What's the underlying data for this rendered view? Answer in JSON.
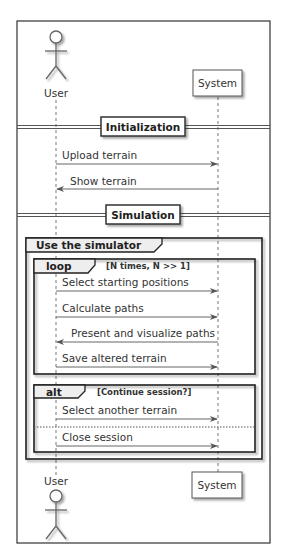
{
  "diagram": {
    "type": "sequence",
    "participants": [
      {
        "id": "user",
        "label": "User",
        "kind": "actor"
      },
      {
        "id": "system",
        "label": "System",
        "kind": "participant"
      }
    ],
    "dividers": [
      {
        "label": "Initialization"
      },
      {
        "label": "Simulation"
      }
    ],
    "messages": [
      {
        "from": "user",
        "to": "system",
        "label": "Upload terrain"
      },
      {
        "from": "system",
        "to": "user",
        "label": "Show terrain"
      },
      {
        "from": "user",
        "to": "system",
        "label": "Select starting positions"
      },
      {
        "from": "user",
        "to": "system",
        "label": "Calculate paths"
      },
      {
        "from": "system",
        "to": "user",
        "label": "Present and visualize paths"
      },
      {
        "from": "user",
        "to": "system",
        "label": "Save altered terrain"
      },
      {
        "from": "user",
        "to": "system",
        "label": "Select another terrain"
      },
      {
        "from": "user",
        "to": "system",
        "label": "Close session"
      }
    ],
    "groups": [
      {
        "kind": "group",
        "label": "Use the simulator",
        "guard": ""
      },
      {
        "kind": "loop",
        "label": "loop",
        "guard": "[N times, N >> 1]"
      },
      {
        "kind": "alt",
        "label": "alt",
        "guard": "[Continue session?]"
      }
    ]
  }
}
